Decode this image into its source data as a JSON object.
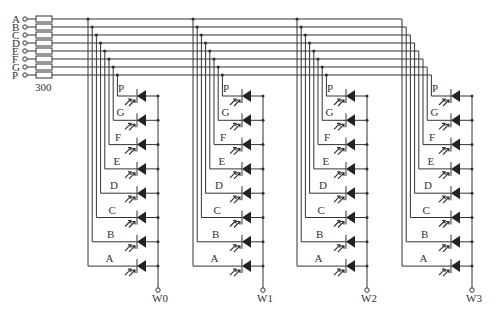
{
  "diagram": {
    "inputs": [
      "A",
      "B",
      "C",
      "D",
      "E",
      "F",
      "G",
      "P"
    ],
    "resistor_label": "300",
    "digits": [
      {
        "name": "W0",
        "x": 88
      },
      {
        "name": "W1",
        "x": 193
      },
      {
        "name": "W2",
        "x": 297
      },
      {
        "name": "W3",
        "x": 402
      }
    ],
    "segment_order_top_to_bottom": [
      "P",
      "G",
      "F",
      "E",
      "D",
      "C",
      "B",
      "A"
    ],
    "colors": {
      "line": "#333333",
      "background": "#ffffff"
    }
  }
}
